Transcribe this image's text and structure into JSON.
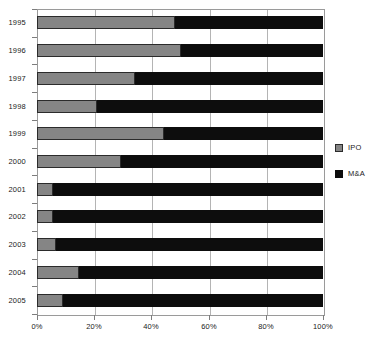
{
  "chart_data": {
    "type": "bar",
    "orientation": "horizontal",
    "stacked": true,
    "normalized": "100%",
    "title": "",
    "subtitle": "",
    "xlabel": "",
    "ylabel": "",
    "xlim": [
      0,
      100
    ],
    "grid": true,
    "legend_position": "right",
    "categories": [
      "1995",
      "1996",
      "1997",
      "1998",
      "1999",
      "2000",
      "2001",
      "2002",
      "2003",
      "2004",
      "2005"
    ],
    "xticks": [
      0,
      20,
      40,
      60,
      80,
      100
    ],
    "xticklabels": [
      "0%",
      "20%",
      "40%",
      "60%",
      "80%",
      "100%"
    ],
    "series": [
      {
        "name": "IPO",
        "color": "#858585",
        "values": [
          48.4,
          50.3,
          34.3,
          21.0,
          44.4,
          29.4,
          5.6,
          5.6,
          6.6,
          14.7,
          9.1
        ]
      },
      {
        "name": "M&A",
        "color": "#0d0d0d",
        "values": [
          51.6,
          49.7,
          65.7,
          79.0,
          55.6,
          70.6,
          94.4,
          94.4,
          93.4,
          85.3,
          90.9
        ]
      }
    ]
  },
  "legend": {
    "items": [
      {
        "label": "IPO",
        "swatch": "ipo"
      },
      {
        "label": "M&A",
        "swatch": "ma"
      }
    ]
  }
}
